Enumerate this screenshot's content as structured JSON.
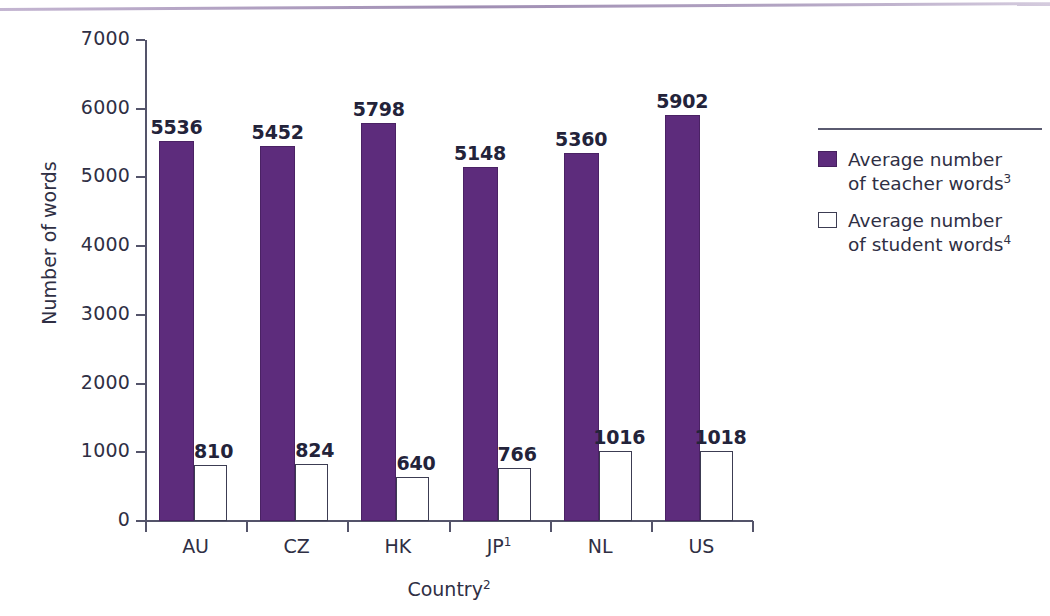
{
  "chart_data": {
    "type": "bar",
    "title": "",
    "xlabel": "Country2",
    "xlabel_text": "Country",
    "xlabel_sup": "2",
    "ylabel": "Number of words",
    "ylim": [
      0,
      7000
    ],
    "ytick_values": [
      0,
      1000,
      2000,
      3000,
      4000,
      5000,
      6000,
      7000
    ],
    "ytick_labels": [
      "0",
      "1000",
      "2000",
      "3000",
      "4000",
      "5000",
      "6000",
      "7000"
    ],
    "grid": false,
    "legend_position": "right",
    "categories": [
      "AU",
      "CZ",
      "HK",
      "JP",
      "NL",
      "US"
    ],
    "category_labels": [
      {
        "text": "AU",
        "sup": ""
      },
      {
        "text": "CZ",
        "sup": ""
      },
      {
        "text": "HK",
        "sup": ""
      },
      {
        "text": "JP",
        "sup": "1"
      },
      {
        "text": "NL",
        "sup": ""
      },
      {
        "text": "US",
        "sup": ""
      }
    ],
    "series": [
      {
        "name": "Average number of teacher words3",
        "name_text": "Average number of teacher words",
        "name_sup": "3",
        "color": "#5d2c7c",
        "values": [
          5536,
          5452,
          5798,
          5148,
          5360,
          5902
        ]
      },
      {
        "name": "Average number of student words4",
        "name_text": "Average number of student words",
        "name_sup": "4",
        "color": "#ffffff",
        "values": [
          810,
          824,
          640,
          766,
          1016,
          1018
        ]
      }
    ]
  },
  "legend": {
    "items": [
      {
        "line1": "Average number",
        "line2": "of teacher words",
        "sup": "3",
        "swatch": "filled"
      },
      {
        "line1": "Average number",
        "line2": "of student words",
        "sup": "4",
        "swatch": "hollow"
      }
    ]
  },
  "colors": {
    "bar_purple": "#5d2c7c",
    "bar_white": "#ffffff",
    "axis": "#54546a",
    "text": "#2f2f44",
    "top_rule": "#9d89b2"
  }
}
